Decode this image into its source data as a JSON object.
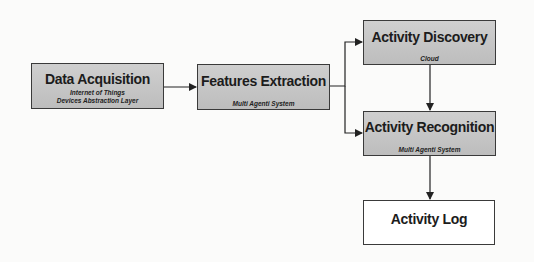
{
  "diagram": {
    "nodes": [
      {
        "id": "data_acquisition",
        "title": "Data Acquisition",
        "subtitle_lines": [
          "Internet of Things",
          "Devices Abstraction Layer"
        ]
      },
      {
        "id": "features_extraction",
        "title": "Features Extraction",
        "subtitle_lines": [
          "Multi Agenti System"
        ]
      },
      {
        "id": "activity_discovery",
        "title": "Activity Discovery",
        "subtitle_lines": [
          "Cloud"
        ]
      },
      {
        "id": "activity_recognition",
        "title": "Activity Recognition",
        "subtitle_lines": [
          "Multi Agenti System"
        ]
      },
      {
        "id": "activity_log",
        "title": "Activity Log",
        "subtitle_lines": []
      }
    ],
    "edges": [
      {
        "from": "data_acquisition",
        "to": "features_extraction"
      },
      {
        "from": "features_extraction",
        "to": "activity_discovery"
      },
      {
        "from": "features_extraction",
        "to": "activity_recognition"
      },
      {
        "from": "activity_discovery",
        "to": "activity_recognition"
      },
      {
        "from": "activity_recognition",
        "to": "activity_log"
      }
    ],
    "colors": {
      "box_fill": "#c6c6c6",
      "border": "#3a3a3a",
      "log_fill": "#ffffff"
    }
  }
}
